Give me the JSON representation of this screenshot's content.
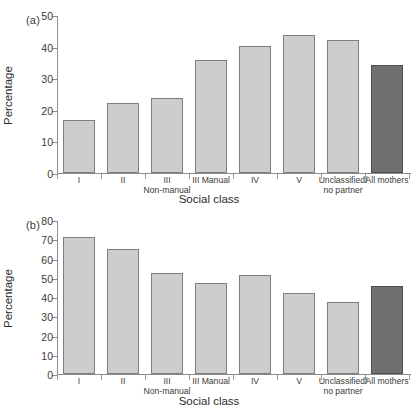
{
  "figure": {
    "background_color": "#ffffff",
    "bar_color": "#cdcdcd",
    "bar_border_color": "#7e7e7e",
    "highlight_bar_color": "#6f6f6f",
    "highlight_bar_border_color": "#4f4f4f",
    "axis_color": "#8c8c8c"
  },
  "chart_data": [
    {
      "type": "bar",
      "panel_label": "(a)",
      "title": "",
      "xlabel": "Social class",
      "ylabel": "Percentage",
      "ylim": [
        0,
        50
      ],
      "yticks": [
        0,
        10,
        20,
        30,
        40,
        50
      ],
      "grid": false,
      "legend": "none",
      "categories": [
        "I",
        "II",
        "III\nNon-manual",
        "III Manual",
        "IV",
        "V",
        "Unclassified/\nno partner",
        "All mothers"
      ],
      "values": [
        16.7,
        22.1,
        23.7,
        35.9,
        40.2,
        43.7,
        42.0,
        34.1
      ],
      "highlight_index": 7
    },
    {
      "type": "bar",
      "panel_label": "(b)",
      "title": "",
      "xlabel": "Social class",
      "ylabel": "Percentage",
      "ylim": [
        0,
        80
      ],
      "yticks": [
        0,
        10,
        20,
        30,
        40,
        50,
        60,
        70,
        80
      ],
      "grid": false,
      "legend": "none",
      "categories": [
        "I",
        "II",
        "III\nNon-manual",
        "III Manual",
        "IV",
        "V",
        "Unclassified/\nno partner",
        "All mothers"
      ],
      "values": [
        71.3,
        64.8,
        52.3,
        47.1,
        51.6,
        42.1,
        37.5,
        45.6
      ],
      "highlight_index": 7
    }
  ]
}
